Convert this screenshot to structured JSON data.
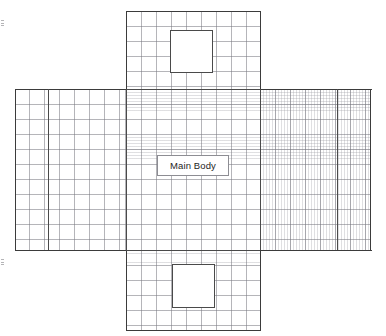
{
  "diagram": {
    "background_color": "#ffffff",
    "outline_color": "#3b3b3b",
    "fold_line_color": "#4a4a4a",
    "grid_major_color": "#787880",
    "grid_minor_color": "#96969e",
    "grid_major_spacing_px": 15,
    "grid_minor_spacing_px": 3,
    "center_label": {
      "text": "Main Body",
      "fill": "#ffffff",
      "border_color": "#8d8d93",
      "text_color": "#1d1d1d"
    },
    "panels": [
      {
        "name": "top-panel",
        "x": 126,
        "y": 11,
        "w": 134,
        "h": 78
      },
      {
        "name": "left-panel",
        "x": 15,
        "y": 89,
        "w": 111,
        "h": 161
      },
      {
        "name": "main-body-panel",
        "x": 126,
        "y": 89,
        "w": 134,
        "h": 161
      },
      {
        "name": "right-panel",
        "x": 260,
        "y": 89,
        "w": 111,
        "h": 161
      },
      {
        "name": "bottom-panel",
        "x": 126,
        "y": 250,
        "w": 134,
        "h": 80
      }
    ],
    "fold_lines": [
      {
        "name": "left-flap-fold",
        "x": 48,
        "y": 89,
        "length": 161,
        "orientation": "vertical"
      },
      {
        "name": "right-flap-fold",
        "x": 337,
        "y": 89,
        "length": 161,
        "orientation": "vertical"
      }
    ],
    "cutouts": [
      {
        "name": "top-cutout",
        "x": 170,
        "y": 30,
        "w": 43,
        "h": 43
      },
      {
        "name": "bottom-cutout",
        "x": 172,
        "y": 264,
        "w": 43,
        "h": 44
      }
    ],
    "artifacts": [
      {
        "name": "margin-mark-upper",
        "y": 20
      },
      {
        "name": "margin-mark-lower",
        "y": 259
      }
    ]
  }
}
